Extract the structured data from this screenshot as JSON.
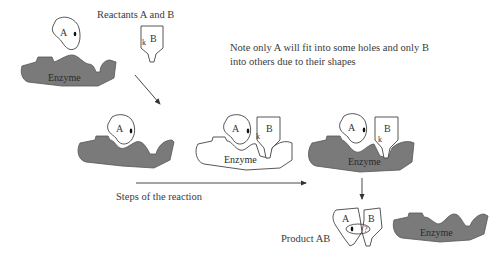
{
  "labels": {
    "reactants": "Reactants A and B",
    "note_line1": "Note only A will fit into some holes and only B",
    "note_line2": "into others due to their shapes",
    "steps": "Steps of the reaction",
    "product": "Product AB",
    "enzyme": "Enzyme",
    "substrate_a": "A",
    "substrate_b": "B",
    "bond_mark": "k"
  },
  "colors": {
    "enzyme_fill": "#7a7a7a",
    "outline": "#444444",
    "background": "#ffffff"
  },
  "stages": [
    {
      "id": "free-reactants",
      "enzyme_shaded": true
    },
    {
      "id": "a-bound",
      "enzyme_shaded": true
    },
    {
      "id": "ab-bound",
      "enzyme_shaded": false
    },
    {
      "id": "ab-bound-reacting",
      "enzyme_shaded": true
    },
    {
      "id": "product-released",
      "enzyme_shaded": true
    }
  ]
}
